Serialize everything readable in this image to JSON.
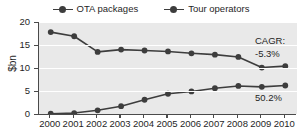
{
  "chart_data": {
    "type": "line",
    "title": "",
    "xlabel": "",
    "ylabel": "$bn",
    "categories": [
      "2000",
      "2001",
      "2002",
      "2003",
      "2004",
      "2005",
      "2006",
      "2007",
      "2008",
      "2009",
      "2010"
    ],
    "ylim": [
      0,
      20
    ],
    "yticks": [
      0,
      5,
      10,
      15,
      20
    ],
    "grid": true,
    "legend_position": "top-center",
    "series": [
      {
        "name": "OTA packages",
        "color": "#3d3d3d",
        "values": [
          17.8,
          16.9,
          13.5,
          14.0,
          13.8,
          13.6,
          13.2,
          12.9,
          12.4,
          10.1,
          10.4
        ]
      },
      {
        "name": "Tour operators",
        "color": "#3d3d3d",
        "values": [
          0.05,
          0.2,
          0.8,
          1.7,
          3.1,
          4.4,
          4.9,
          5.6,
          6.1,
          5.9,
          6.2
        ]
      }
    ],
    "annotations": [
      {
        "id": "cagr-title",
        "text": "CAGR:"
      },
      {
        "id": "cagr-ota",
        "text": "-5.3%"
      },
      {
        "id": "cagr-tour",
        "text": "50.2%"
      }
    ]
  },
  "legend": {
    "items": [
      {
        "label": "OTA packages",
        "marker": "line-circle-marker"
      },
      {
        "label": "Tour operators",
        "marker": "line-circle-marker"
      }
    ]
  },
  "axis": {
    "y_title": "$bn",
    "y_tick_labels": [
      "20",
      "15",
      "10",
      "5",
      "0"
    ],
    "x_tick_labels": [
      "2000",
      "2001",
      "2002",
      "2003",
      "2004",
      "2005",
      "2006",
      "2007",
      "2008",
      "2009",
      "2010"
    ]
  },
  "annotations": {
    "cagr_title": "CAGR:",
    "cagr_ota": "-5.3%",
    "cagr_tour": "50.2%"
  },
  "colors": {
    "plot_background": "#e9e9e9",
    "gridline": "#ffffff",
    "series_line": "#3d3d3d",
    "axis": "#4a4a4a",
    "text": "#1f1f1f"
  }
}
